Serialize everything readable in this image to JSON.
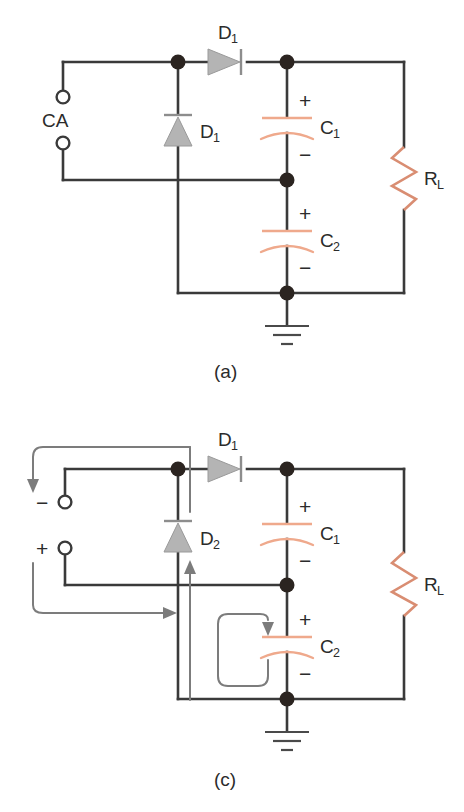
{
  "figure": {
    "type": "circuit-diagram",
    "colors": {
      "wire": "#3a3a3a",
      "node": "#2b2420",
      "diode_fill": "#b4b4b4",
      "capacitor": "#efa98c",
      "resistor": "#d98d72",
      "flow_arrow": "#7c7c7c",
      "text": "#2b2b2b",
      "background": "#ffffff"
    },
    "panels": [
      {
        "id": "a",
        "caption": "(a)",
        "source_label": "CA",
        "labels": {
          "diode_horizontal": "D",
          "diode_horizontal_sub": "1",
          "diode_vertical": "D",
          "diode_vertical_sub": "1",
          "cap_top": "C",
          "cap_top_sub": "1",
          "cap_bottom": "C",
          "cap_bottom_sub": "2",
          "resistor": "R",
          "resistor_sub": "L"
        },
        "polarity": {
          "c1_plus": "+",
          "c1_minus": "−",
          "c2_plus": "+",
          "c2_minus": "−"
        }
      },
      {
        "id": "c",
        "caption": "(c)",
        "terminal_minus": "−",
        "terminal_plus": "+",
        "labels": {
          "diode_horizontal": "D",
          "diode_horizontal_sub": "1",
          "diode_vertical": "D",
          "diode_vertical_sub": "2",
          "cap_top": "C",
          "cap_top_sub": "1",
          "cap_bottom": "C",
          "cap_bottom_sub": "2",
          "resistor": "R",
          "resistor_sub": "L"
        },
        "polarity": {
          "c1_plus": "+",
          "c1_minus": "−",
          "c2_plus": "+",
          "c2_minus": "−"
        },
        "flow_arrows": [
          "top-left-down-arrow",
          "bottom-left-right-arrow",
          "center-up-arrow",
          "c2-loop-down-arrow"
        ]
      }
    ]
  }
}
